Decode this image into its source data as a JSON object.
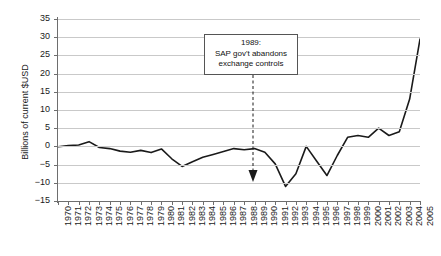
{
  "chart_data": {
    "type": "line",
    "title": "",
    "xlabel": "",
    "ylabel": "Billions of current $USD",
    "ylim": [
      -15,
      35
    ],
    "ytick_values": [
      35,
      30,
      25,
      20,
      15,
      10,
      5,
      0,
      -5,
      -10,
      -15
    ],
    "ytick_labels": [
      "35",
      "30",
      "25",
      "20",
      "15",
      "10",
      "5",
      "0",
      "−5",
      "−10",
      "−15"
    ],
    "grid": true,
    "legend": "none",
    "xlim": [
      1970,
      2005
    ],
    "categories": [
      "1970",
      "1971",
      "1972",
      "1973",
      "1974",
      "1975",
      "1976",
      "1977",
      "1978",
      "1979",
      "1980",
      "1981",
      "1982",
      "1983",
      "1984",
      "1985",
      "1986",
      "1987",
      "1988",
      "1989",
      "1990",
      "1991",
      "1992",
      "1993",
      "1994",
      "1995",
      "1996",
      "1997",
      "1998",
      "1999",
      "2000",
      "2001",
      "2002",
      "2003",
      "2004",
      "2005"
    ],
    "x": [
      1970,
      1971,
      1972,
      1973,
      1974,
      1975,
      1976,
      1977,
      1978,
      1979,
      1980,
      1981,
      1982,
      1983,
      1984,
      1985,
      1986,
      1987,
      1988,
      1989,
      1990,
      1991,
      1992,
      1993,
      1994,
      1995,
      1996,
      1997,
      1998,
      1999,
      2000,
      2001,
      2002,
      2003,
      2004,
      2005
    ],
    "values": [
      -0.1,
      0.2,
      0.4,
      1.3,
      -0.3,
      -0.6,
      -1.3,
      -1.6,
      -1.1,
      -1.7,
      -0.7,
      -3.4,
      -5.5,
      -4.2,
      -3.0,
      -2.2,
      -1.4,
      -0.6,
      -0.9,
      -0.6,
      -1.6,
      -4.8,
      -11.0,
      -7.5,
      0.0,
      -4.0,
      -8.0,
      -2.5,
      2.5,
      3.0,
      2.5,
      5.0,
      3.0,
      4.0,
      13.0,
      29.5
    ],
    "series_note": "Current account balance",
    "annotations": [
      {
        "name": "sap-annotation",
        "lines": [
          "1989:",
          "SAP gov't abandons",
          "exchange controls"
        ],
        "target_year": "1989",
        "arrow": "down-dashed"
      }
    ],
    "colors": {
      "line": "#1a1a1a",
      "grid": "#c9c9c9",
      "axis": "#6e6e6e",
      "text": "#1a1a1a",
      "annotation_border": "#555555",
      "background": "#ffffff"
    }
  }
}
